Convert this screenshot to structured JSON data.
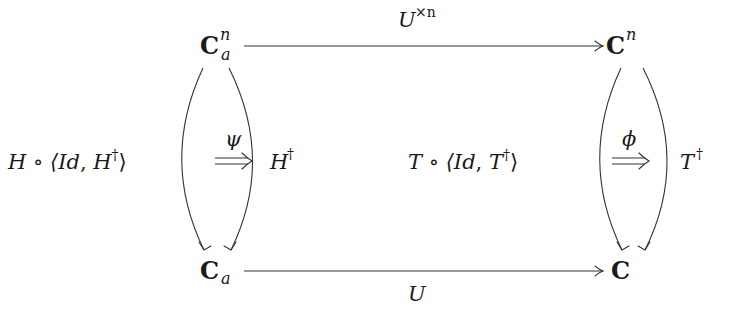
{
  "diagram": {
    "type": "commutative-diagram",
    "nodes": {
      "top_left": {
        "base": "C",
        "sup": "n",
        "sub": "a"
      },
      "top_right": {
        "base": "C",
        "sup": "n"
      },
      "bottom_left": {
        "base": "C",
        "sub": "a"
      },
      "bottom_right": {
        "base": "C"
      }
    },
    "arrows": {
      "top": {
        "label_base": "U",
        "label_sup": "×n"
      },
      "bottom": {
        "label": "U"
      },
      "left_outer": {
        "label_main": "H ∘ ⟨",
        "label_id": "Id",
        "label_sep": ", ",
        "label_h": "H",
        "label_dagger": "†",
        "label_close": "⟩"
      },
      "left_inner": {
        "label_base": "H",
        "label_sup": "†"
      },
      "right_outer": {
        "label_main": "T ∘ ⟨",
        "label_id": "Id",
        "label_sep": ", ",
        "label_t": "T",
        "label_dagger": "†",
        "label_close": "⟩"
      },
      "right_inner": {
        "label_base": "T",
        "label_sup": "†"
      }
    },
    "two_cells": {
      "left": {
        "label": "ψ",
        "arrow": "⟹"
      },
      "right": {
        "label": "ϕ",
        "arrow": "⟹"
      }
    },
    "colors": {
      "stroke": "#333333",
      "text": "#1a1a1a",
      "background": "#ffffff"
    }
  }
}
